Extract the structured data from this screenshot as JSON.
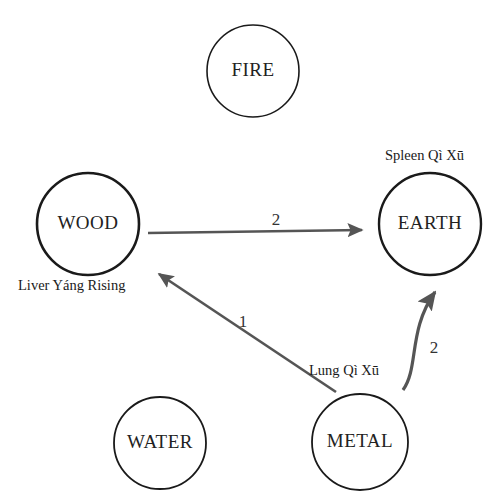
{
  "diagram": {
    "background_color": "#ffffff",
    "node_stroke_color": "#1a1a1a",
    "edge_color": "#555555",
    "text_color": "#1a1a1a",
    "nodes": [
      {
        "id": "fire",
        "label": "FIRE",
        "cx": 253,
        "cy": 71,
        "r": 46,
        "stroke_width": 1.6
      },
      {
        "id": "wood",
        "label": "WOOD",
        "cx": 88,
        "cy": 224,
        "r": 51,
        "stroke_width": 2.6
      },
      {
        "id": "earth",
        "label": "EARTH",
        "cx": 430,
        "cy": 224,
        "r": 51,
        "stroke_width": 2.4
      },
      {
        "id": "water",
        "label": "WATER",
        "cx": 160,
        "cy": 443,
        "r": 46,
        "stroke_width": 1.8
      },
      {
        "id": "metal",
        "label": "METAL",
        "cx": 360,
        "cy": 442,
        "r": 48,
        "stroke_width": 1.8
      }
    ],
    "pattern_labels": [
      {
        "id": "spleen-qi-xu",
        "text": "Spleen Qì Xū",
        "x": 385,
        "y": 160,
        "anchor": "start"
      },
      {
        "id": "liver-yang-rising",
        "text": "Liver Yáng Rising",
        "x": 18,
        "y": 290,
        "anchor": "start"
      },
      {
        "id": "lung-qi-xu",
        "text": "Lung Qì Xū",
        "x": 309,
        "y": 375,
        "anchor": "start"
      }
    ],
    "edges": [
      {
        "id": "wood-to-earth",
        "from": "wood",
        "to": "earth",
        "number": "2",
        "number_x": 276,
        "number_y": 225,
        "shape": "straight",
        "path": "M 148 233 L 362 230"
      },
      {
        "id": "metal-to-wood",
        "from": "metal",
        "to": "wood",
        "number": "1",
        "number_x": 243,
        "number_y": 327,
        "shape": "straight",
        "path": "M 336 392 L 159 274"
      },
      {
        "id": "metal-to-earth",
        "from": "metal",
        "to": "earth",
        "number": "2",
        "number_x": 434,
        "number_y": 353,
        "shape": "curved",
        "path": "M 403 390 C 419 368 408 330 435 292"
      }
    ]
  }
}
